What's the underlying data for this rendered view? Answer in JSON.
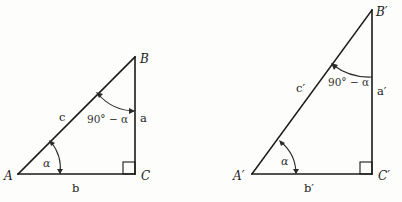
{
  "diagram": {
    "left_triangle": {
      "vertices": {
        "A": "A",
        "B": "B",
        "C": "C"
      },
      "sides": {
        "hypotenuse": "c",
        "opposite": "a",
        "adjacent": "b"
      },
      "angles": {
        "at_A": "α",
        "at_B": "90° − α"
      },
      "right_angle_at": "C"
    },
    "right_triangle": {
      "vertices": {
        "A": "A′",
        "B": "B′",
        "C": "C′"
      },
      "sides": {
        "hypotenuse": "c′",
        "opposite": "a′",
        "adjacent": "b′"
      },
      "angles": {
        "at_A": "α",
        "at_B": "90° − α"
      },
      "right_angle_at": "C′"
    }
  }
}
